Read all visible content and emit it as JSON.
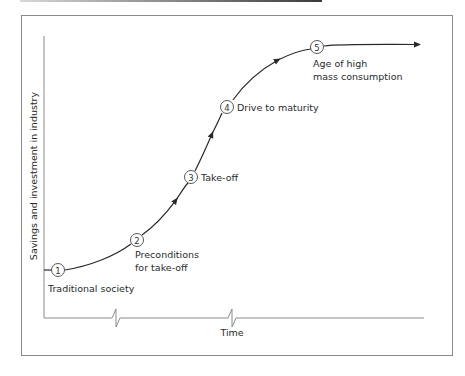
{
  "diagram": {
    "type": "stages-of-growth-curve",
    "y_axis_label": "Savings and investment in industry",
    "x_axis_label": "Time",
    "stages": [
      {
        "number": "1",
        "label_lines": [
          "Traditional society"
        ]
      },
      {
        "number": "2",
        "label_lines": [
          "Preconditions",
          "for take-off"
        ]
      },
      {
        "number": "3",
        "label_lines": [
          "Take-off"
        ]
      },
      {
        "number": "4",
        "label_lines": [
          "Drive to maturity"
        ]
      },
      {
        "number": "5",
        "label_lines": [
          "Age of high",
          "mass consumption"
        ]
      }
    ],
    "colors": {
      "line": "#2a2a2a",
      "axis": "#8a8a8a",
      "frame": "#8a8a8a"
    }
  }
}
